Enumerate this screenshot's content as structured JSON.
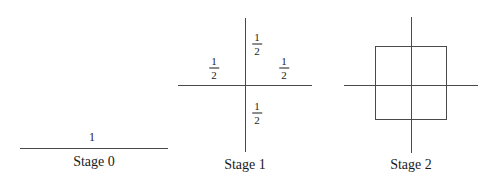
{
  "figure": {
    "background_color": "#ffffff",
    "stroke_color": "#4a4a4a",
    "text_color": "#1a1a1a",
    "panels": [
      {
        "id": "stage-0",
        "caption": "Stage 0",
        "labels": [
          {
            "kind": "scalar",
            "text": "1"
          }
        ]
      },
      {
        "id": "stage-1",
        "caption": "Stage 1",
        "labels": [
          {
            "kind": "fraction",
            "numerator": "1",
            "denominator": "2",
            "position": "up"
          },
          {
            "kind": "fraction",
            "numerator": "1",
            "denominator": "2",
            "position": "left"
          },
          {
            "kind": "fraction",
            "numerator": "1",
            "denominator": "2",
            "position": "right"
          },
          {
            "kind": "fraction",
            "numerator": "1",
            "denominator": "2",
            "position": "down"
          }
        ]
      },
      {
        "id": "stage-2",
        "caption": "Stage 2",
        "labels": []
      }
    ]
  },
  "stage0": {
    "caption": "Stage 0",
    "length_label": "1"
  },
  "stage1": {
    "caption": "Stage 1",
    "up": {
      "num": "1",
      "den": "2"
    },
    "left": {
      "num": "1",
      "den": "2"
    },
    "right": {
      "num": "1",
      "den": "2"
    },
    "down": {
      "num": "1",
      "den": "2"
    }
  },
  "stage2": {
    "caption": "Stage 2"
  }
}
